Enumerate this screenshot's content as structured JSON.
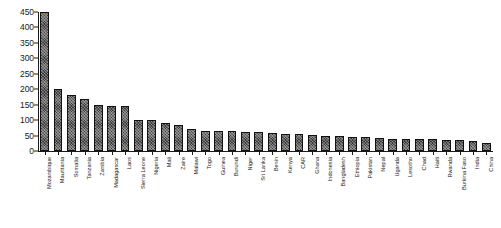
{
  "chart_data": {
    "type": "bar",
    "title": "",
    "subtitle": "",
    "xlabel": "",
    "ylabel": "",
    "ylim": [
      0,
      450
    ],
    "ytick_step": 50,
    "yticks": [
      0,
      50,
      100,
      150,
      200,
      250,
      300,
      350,
      400,
      450
    ],
    "grid": false,
    "legend": false,
    "legend_position": "none",
    "bar_color": "#3a3a3a",
    "bar_edge_color": "#111111",
    "axis_color": "#1a1a1a",
    "categories": [
      "Mozambique",
      "Mauritania",
      "Somalia",
      "Tanzania",
      "Zambia",
      "Madagascar",
      "Laos",
      "Sierra Leone",
      "Nigeria",
      "Mali",
      "Zaire",
      "Malawi",
      "Togo",
      "Guinea",
      "Burundi",
      "Niger",
      "Sri Lanka",
      "Benin",
      "Kenya",
      "CAR",
      "Ghana",
      "Indonesia",
      "Bangladesh",
      "Ethiopia",
      "Pakistan",
      "Nepal",
      "Uganda",
      "Lesotho",
      "Chad",
      "Haiti",
      "Rwanda",
      "Burkina Faso",
      "India",
      "China"
    ],
    "values": [
      450,
      200,
      180,
      170,
      150,
      145,
      145,
      100,
      100,
      90,
      85,
      70,
      65,
      65,
      65,
      62,
      60,
      58,
      55,
      55,
      52,
      50,
      48,
      45,
      45,
      42,
      40,
      40,
      38,
      38,
      36,
      35,
      33,
      25
    ]
  }
}
